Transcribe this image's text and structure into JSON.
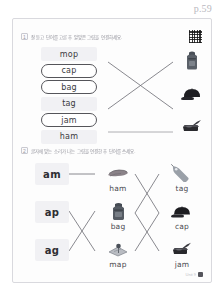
{
  "page": {
    "page_label": "p.59",
    "footer_text": "Unit 9",
    "footer_badge": "59"
  },
  "section1": {
    "number": "1",
    "instruction": "잘 듣고 단어를 고른 후 알맞은 그림을 연결하세요.",
    "qr_icon": "qr-code-icon",
    "words": [
      {
        "text": "mop",
        "selected": false
      },
      {
        "text": "cap",
        "selected": true
      },
      {
        "text": "bag",
        "selected": true
      },
      {
        "text": "tag",
        "selected": false
      },
      {
        "text": "jam",
        "selected": true
      },
      {
        "text": "ham",
        "selected": false
      }
    ],
    "images": [
      {
        "name": "backpack-image",
        "label": "bag",
        "icon": "backpack-icon"
      },
      {
        "name": "cap-image",
        "label": "cap",
        "icon": "baseball-cap-icon"
      },
      {
        "name": "jam-image",
        "label": "jam",
        "icon": "jam-jar-icon"
      }
    ],
    "connections": [
      {
        "from": "cap",
        "to": "jam"
      },
      {
        "from": "jam",
        "to": "bag"
      },
      {
        "from": "bag",
        "to": "cap"
      }
    ]
  },
  "section2": {
    "number": "2",
    "instruction": "글자에 맞는 소리가 나는 그림을 연결한 후 단어를 쓰세요.",
    "rimes": [
      "am",
      "ap",
      "ag"
    ],
    "middle": [
      {
        "label": "ham",
        "icon": "ham-slice-icon"
      },
      {
        "label": "bag",
        "icon": "backpack-icon"
      },
      {
        "label": "map",
        "icon": "map-icon"
      }
    ],
    "right": [
      {
        "label": "tag",
        "icon": "price-tag-icon"
      },
      {
        "label": "cap",
        "icon": "baseball-cap-icon"
      },
      {
        "label": "jam",
        "icon": "jam-jar-icon"
      }
    ]
  },
  "colors": {
    "line": "#6b6b72",
    "word_bg": "#f1f1f4",
    "text": "#3a3a3e",
    "muted": "#b9b9c0"
  }
}
